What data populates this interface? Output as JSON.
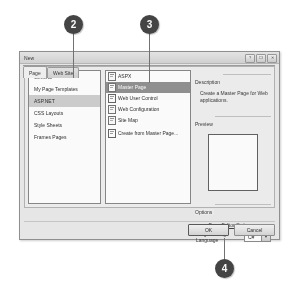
{
  "figure": {
    "callouts": [
      {
        "number": "2"
      },
      {
        "number": "3"
      },
      {
        "number": "4"
      }
    ]
  },
  "dialog": {
    "title": "New",
    "window_buttons": [
      {
        "name": "help-button",
        "glyph": "?"
      },
      {
        "name": "maximize-button",
        "glyph": "❐"
      },
      {
        "name": "close-button",
        "glyph": "✕"
      }
    ],
    "tabs": [
      {
        "label": "Page",
        "active": true
      },
      {
        "label": "Web Site",
        "active": false
      }
    ],
    "categories": [
      {
        "label": "General",
        "selected": false
      },
      {
        "label": "My Page Templates",
        "selected": false
      },
      {
        "label": "ASP.NET",
        "selected": true
      },
      {
        "label": "CSS Layouts",
        "selected": false
      },
      {
        "label": "Style Sheets",
        "selected": false
      },
      {
        "label": "Frames Pages",
        "selected": false
      }
    ],
    "templates": [
      {
        "label": "ASPX",
        "icon": "aspx-page-icon",
        "selected": false
      },
      {
        "label": "Master Page",
        "icon": "master-page-icon",
        "selected": true
      },
      {
        "label": "Web User Control",
        "icon": "web-user-control-icon",
        "selected": false
      },
      {
        "label": "Web Configuration",
        "icon": "web-configuration-icon",
        "selected": false
      },
      {
        "label": "Site Map",
        "icon": "site-map-icon",
        "selected": false
      },
      {
        "label": "Create from Master Page...",
        "icon": "create-from-master-page-icon",
        "selected": false
      }
    ],
    "description": {
      "group_label": "Description",
      "text": "Create a Master Page for Web applications."
    },
    "preview": {
      "group_label": "Preview"
    },
    "options": {
      "group_label": "Options",
      "page_editor_options_link": "Page Editor Options...",
      "programming_language_label": "Programming Language",
      "programming_language_value": "C#",
      "dropdown_glyph": "▼"
    },
    "buttons": [
      {
        "label": "OK",
        "name": "ok-button",
        "default": true
      },
      {
        "label": "Cancel",
        "name": "cancel-button",
        "default": false
      }
    ]
  },
  "colors": {
    "callout_fill": "#3d3d3d",
    "callout_text": "#ffffff",
    "selection_fill": "#8d8d8d",
    "category_selection_fill": "#cfcdc8",
    "dialog_face": "#eceae4",
    "leader_line": "#6e6e6e"
  }
}
